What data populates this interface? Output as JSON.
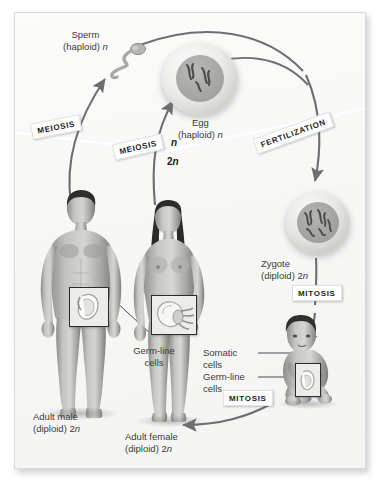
{
  "figure": {
    "background_color": "#ffffff",
    "panel_color": "#f7f7f6",
    "text_color": "#3b3b3b",
    "label_box_color": "#ffffff"
  },
  "cells": {
    "sperm": {
      "name": "Sperm",
      "ploidy": "(haploid) ",
      "symbol": "n"
    },
    "egg": {
      "name": "Egg",
      "ploidy": "(haploid) ",
      "symbol": "n"
    },
    "zygote": {
      "name": "Zygote",
      "ploidy": "(diploid) 2",
      "symbol": "n"
    }
  },
  "organisms": {
    "adult_male": {
      "name": "Adult male",
      "ploidy": "(diploid) 2",
      "symbol": "n"
    },
    "adult_female": {
      "name": "Adult female",
      "ploidy": "(diploid) 2",
      "symbol": "n"
    },
    "child": {
      "name": "Child"
    }
  },
  "process_labels": {
    "meiosis_male": "MEIOSIS",
    "meiosis_female": "MEIOSIS",
    "fertilization": "FERTILIZATION",
    "mitosis_zygote": "MITOSIS",
    "mitosis_growth": "MITOSIS"
  },
  "ploidy_markers": {
    "haploid": "n",
    "diploid_prefix": "2",
    "diploid_symbol": "n"
  },
  "cell_type_labels": {
    "somatic_line1": "Somatic",
    "somatic_line2": "cells",
    "germline_adults_line1": "Germ-line",
    "germline_adults_line2": "cells",
    "germline_child_line1": "Germ-line",
    "germline_child_line2": "cells"
  }
}
